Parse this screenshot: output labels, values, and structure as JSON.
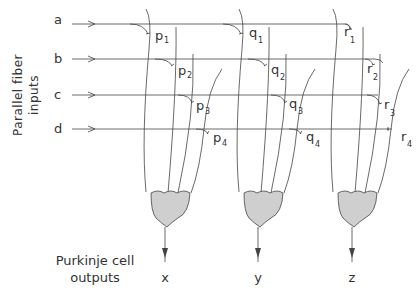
{
  "side_label": {
    "line1": "Parallel  fiber",
    "line2": "inputs"
  },
  "bottom_label": {
    "line1": "Purkinje  cell",
    "line2": "outputs"
  },
  "inputs": [
    {
      "label": "a",
      "y": 20
    },
    {
      "label": "b",
      "y": 59
    },
    {
      "label": "c",
      "y": 95
    },
    {
      "label": "d",
      "y": 129
    }
  ],
  "cells": [
    {
      "output": "x",
      "cx": 165,
      "synapses": [
        {
          "letter": "p",
          "sub": "1"
        },
        {
          "letter": "p",
          "sub": "2"
        },
        {
          "letter": "p",
          "sub": "3"
        },
        {
          "letter": "p",
          "sub": "4"
        }
      ]
    },
    {
      "output": "y",
      "cx": 258,
      "synapses": [
        {
          "letter": "q",
          "sub": "1"
        },
        {
          "letter": "q",
          "sub": "2"
        },
        {
          "letter": "q",
          "sub": "3"
        },
        {
          "letter": "q",
          "sub": "4"
        }
      ]
    },
    {
      "output": "z",
      "cx": 352,
      "synapses": [
        {
          "letter": "r",
          "sub": "1"
        },
        {
          "letter": "r",
          "sub": "2"
        },
        {
          "letter": "r",
          "sub": "3"
        },
        {
          "letter": "r",
          "sub": "4"
        }
      ]
    }
  ],
  "colors": {
    "line": "#444444",
    "soma_fill": "#cfcfcf",
    "text": "#333333"
  }
}
